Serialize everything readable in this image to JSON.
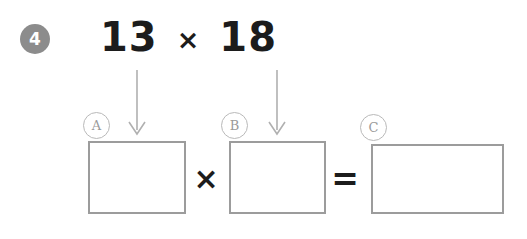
{
  "worksheet": {
    "question_number": "4",
    "problem": {
      "left_operand": "13",
      "operator": "×",
      "right_operand": "18"
    },
    "arrows": [
      {
        "name": "arrow-from-13-to-box-a",
        "direction": "down"
      },
      {
        "name": "arrow-from-18-to-box-b",
        "direction": "down"
      }
    ],
    "equation": {
      "box_a_label": "A",
      "box_a_value": "",
      "times_operator": "×",
      "box_b_label": "B",
      "box_b_value": "",
      "equals_operator": "=",
      "box_c_label": "C",
      "box_c_value": ""
    },
    "colors": {
      "badge_fill": "#8c8c8c",
      "badge_text": "#ffffff",
      "problem_text": "#1c1c1c",
      "box_border": "#9c9c9c",
      "circle_label_border": "#b9b9b9",
      "circle_label_text": "#9a9a9a",
      "arrow": "#b0b0b0",
      "background": "#ffffff"
    }
  }
}
